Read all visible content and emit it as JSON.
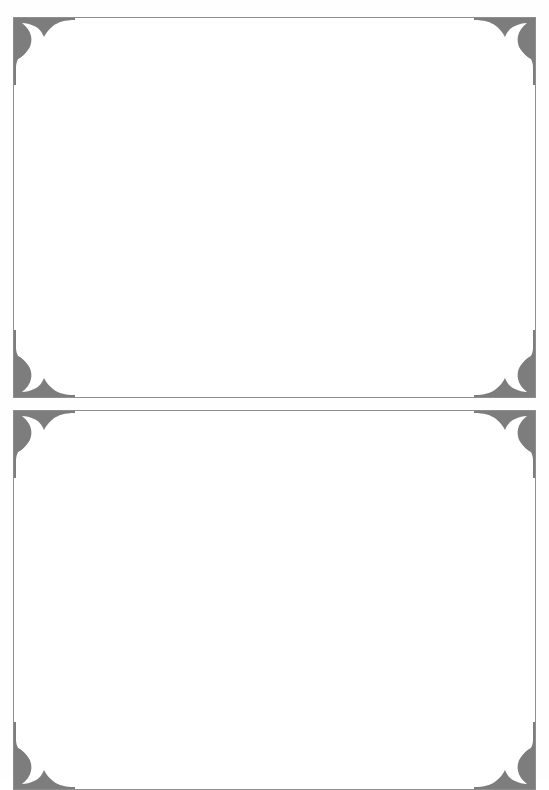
{
  "page": {
    "background_color": "#ffffff",
    "width": 549,
    "height": 778,
    "top_mark": "·",
    "ornament_color": "#7d7d7d",
    "border_color": "#8e8e8e"
  },
  "frames": [
    {
      "id": "frame-1",
      "label": "decorative-frame-top",
      "content": "",
      "corners": [
        {
          "name": "corner-ornament-top-left",
          "position": "top-left"
        },
        {
          "name": "corner-ornament-top-right",
          "position": "top-right"
        },
        {
          "name": "corner-ornament-bottom-left",
          "position": "bottom-left"
        },
        {
          "name": "corner-ornament-bottom-right",
          "position": "bottom-right"
        }
      ]
    },
    {
      "id": "frame-2",
      "label": "decorative-frame-bottom",
      "content": "",
      "corners": [
        {
          "name": "corner-ornament-top-left",
          "position": "top-left"
        },
        {
          "name": "corner-ornament-top-right",
          "position": "top-right"
        },
        {
          "name": "corner-ornament-bottom-left",
          "position": "bottom-left"
        },
        {
          "name": "corner-ornament-bottom-right",
          "position": "bottom-right"
        }
      ]
    }
  ]
}
